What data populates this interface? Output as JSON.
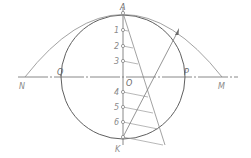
{
  "diagram": {
    "type": "geometric-construction",
    "colors": {
      "line": "#6f6f6f",
      "thin": "#9a9a9a",
      "label": "#8a8a8a"
    },
    "labels": {
      "A": "A",
      "K": "K",
      "O": "O",
      "P": "P",
      "Q": "Q",
      "N": "N",
      "M": "M",
      "div1": "1",
      "div2": "2",
      "div3": "3",
      "div4": "4",
      "div5": "5",
      "div6": "6"
    },
    "points": {
      "A": [
        123,
        13
      ],
      "K": [
        123,
        137
      ],
      "O": [
        123,
        77
      ],
      "P": [
        183,
        77
      ],
      "Q": [
        62,
        77
      ],
      "N": [
        25,
        77
      ],
      "M": [
        222,
        77
      ]
    },
    "circle": {
      "center": [
        123,
        77
      ],
      "radius": 62
    },
    "divisions_on_axis": [
      {
        "label": "1",
        "y": 30
      },
      {
        "label": "2",
        "y": 46
      },
      {
        "label": "3",
        "y": 61
      },
      {
        "label": "4",
        "y": 92
      },
      {
        "label": "5",
        "y": 107
      },
      {
        "label": "6",
        "y": 122
      }
    ]
  }
}
